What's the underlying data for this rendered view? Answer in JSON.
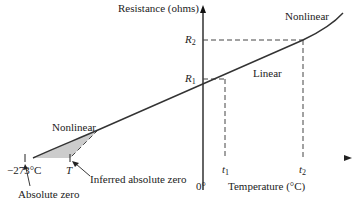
{
  "diagram": {
    "y_axis_label": "Resistance (ohms)",
    "x_axis_label": "Temperature (°C)",
    "origin_label": "0°",
    "regions": {
      "upper_nonlinear": "Nonlinear",
      "linear": "Linear",
      "lower_nonlinear": "Nonlinear"
    },
    "y_ticks": [
      {
        "symbol": "R",
        "sub": "2"
      },
      {
        "symbol": "R",
        "sub": "1"
      }
    ],
    "x_ticks": [
      {
        "symbol": "t",
        "sub": "1"
      },
      {
        "symbol": "t",
        "sub": "2"
      }
    ],
    "absolute_zero_value": "−273°C",
    "inferred_symbol": "T",
    "annotations": {
      "absolute_zero": "Absolute zero",
      "inferred_absolute_zero": "Inferred absolute zero"
    },
    "colors": {
      "line": "#333333",
      "fill": "#cccccc",
      "axis": "#111111"
    }
  }
}
